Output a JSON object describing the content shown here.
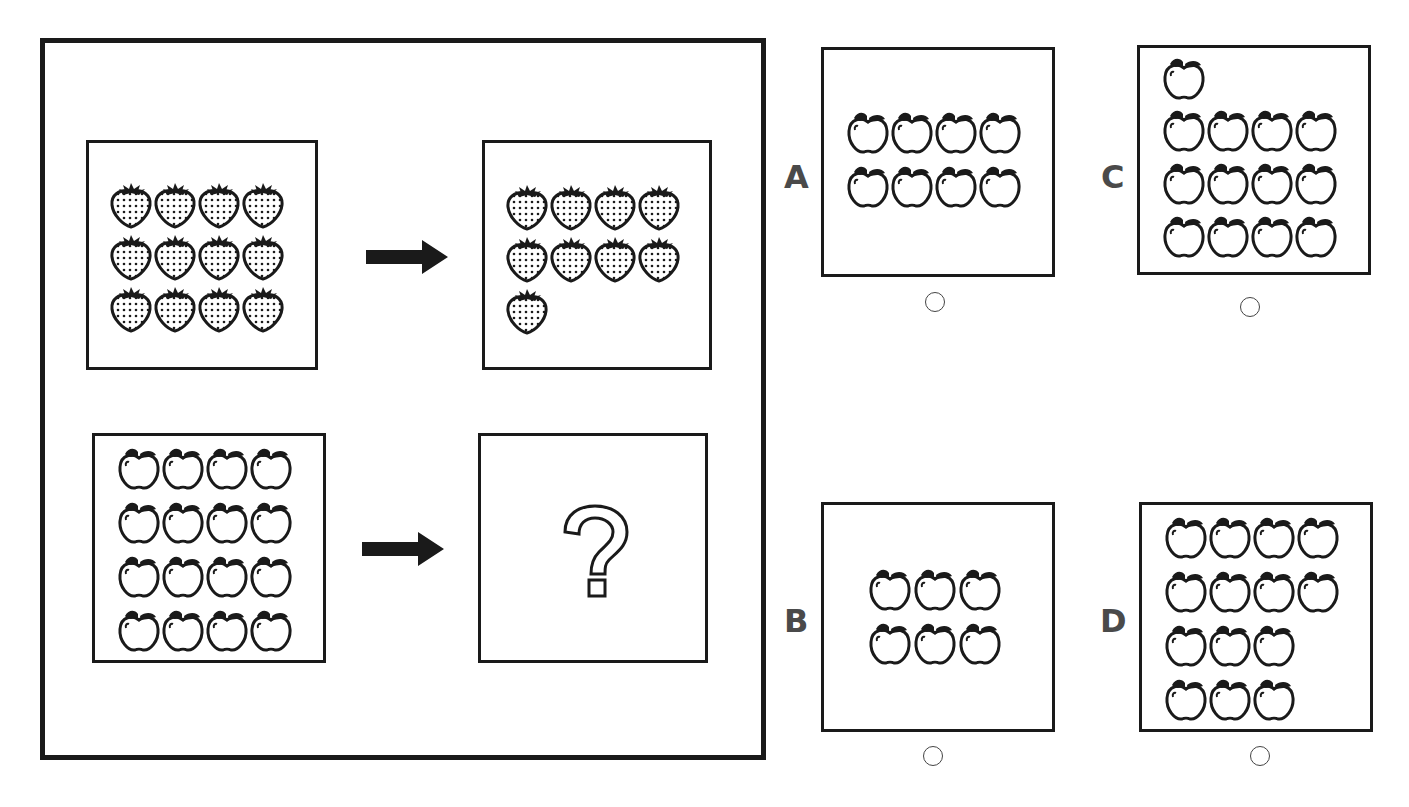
{
  "puzzle": {
    "example_pair": {
      "input": {
        "fruit": "strawberry",
        "rows": [
          4,
          4,
          4
        ],
        "count": 12
      },
      "output": {
        "fruit": "strawberry",
        "rows": [
          4,
          4,
          1
        ],
        "count": 9
      }
    },
    "question_pair": {
      "input": {
        "fruit": "apple",
        "rows": [
          4,
          4,
          4,
          4
        ],
        "count": 16
      },
      "output": {
        "symbol": "?"
      }
    },
    "arrow_icon": "right-arrow"
  },
  "options": [
    {
      "label": "A",
      "fruit": "apple",
      "rows": [
        4,
        4
      ],
      "count": 8,
      "layout": "grid"
    },
    {
      "label": "B",
      "fruit": "apple",
      "rows": [
        3,
        3
      ],
      "count": 6,
      "layout": "grid"
    },
    {
      "label": "C",
      "fruit": "apple",
      "rows": [
        1,
        4,
        4,
        4
      ],
      "count": 13,
      "layout": "extra-on-top"
    },
    {
      "label": "D",
      "fruit": "apple",
      "rows": [
        4,
        4,
        3,
        3
      ],
      "count": 14,
      "layout": "grid"
    }
  ],
  "colors": {
    "stroke": "#1a1a1a",
    "label": "#4a4a4a",
    "background": "#ffffff"
  }
}
